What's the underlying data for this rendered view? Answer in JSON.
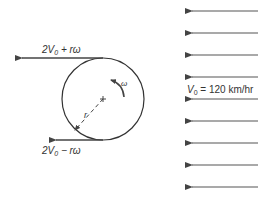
{
  "diagram": {
    "top_arrow_label": {
      "base": "2V",
      "sub": "0",
      "rest": " + rω"
    },
    "bottom_arrow_label": {
      "base": "2V",
      "sub": "0",
      "rest": " − rω"
    },
    "omega_label": "ω",
    "radius_label": "r",
    "freestream_label": {
      "base": "V",
      "sub": "0",
      "rest": " = 120 km/hr"
    },
    "freestream_arrow_count": 9,
    "colors": {
      "line": "#333333",
      "arrow": "#555555",
      "background": "#ffffff"
    }
  }
}
